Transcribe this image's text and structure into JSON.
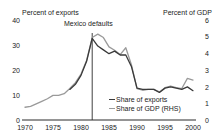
{
  "header": {
    "left_axis_title": "Percent of exports",
    "right_axis_title": "Percent of GDP"
  },
  "annotation": {
    "label": "Mexico defaults",
    "year": 1982
  },
  "legend": {
    "items": [
      {
        "label": "Share of exports",
        "color": "#3a3a3a",
        "axis": "left"
      },
      {
        "label": "Share of GDP (RHS)",
        "color": "#9a9a9a",
        "axis": "right"
      }
    ]
  },
  "axes": {
    "left_ticks": [
      "0",
      "10",
      "20",
      "30",
      "40"
    ],
    "right_ticks": [
      "0",
      "1",
      "2",
      "3",
      "4",
      "5",
      "6"
    ],
    "x_ticks": [
      "1970",
      "1975",
      "1980",
      "1985",
      "1990",
      "1995",
      "2000"
    ]
  },
  "chart_data": {
    "type": "line",
    "title": "",
    "subtitle": "",
    "xlabel": "",
    "ylabel": "Percent of exports",
    "y2label": "Percent of GDP",
    "xlim": [
      1970,
      2000
    ],
    "ylim": [
      0,
      40
    ],
    "y2lim": [
      0,
      6
    ],
    "grid": false,
    "legend_position": "inside-bottom-right",
    "annotations": [
      {
        "text": "Mexico defaults",
        "x": 1982,
        "type": "vline-label"
      }
    ],
    "x": [
      1970,
      1971,
      1972,
      1973,
      1974,
      1975,
      1976,
      1977,
      1978,
      1979,
      1980,
      1981,
      1982,
      1983,
      1984,
      1985,
      1986,
      1987,
      1988,
      1989,
      1990,
      1991,
      1992,
      1993,
      1994,
      1995,
      1996,
      1997,
      1998,
      1999,
      2000
    ],
    "series": [
      {
        "name": "Share of exports",
        "color": "#3a3a3a",
        "axis": "left",
        "units": "percent of exports",
        "values": [
          null,
          null,
          null,
          null,
          null,
          null,
          null,
          null,
          12.0,
          14.0,
          17.5,
          23.0,
          32.0,
          29.0,
          27.5,
          26.0,
          27.0,
          25.5,
          25.5,
          21.0,
          12.5,
          12.0,
          12.0,
          12.0,
          10.8,
          12.5,
          13.0,
          12.5,
          12.0,
          13.0,
          11.5
        ]
      },
      {
        "name": "Share of GDP (RHS)",
        "color": "#9a9a9a",
        "axis": "right",
        "units": "percent of GDP",
        "values": [
          0.75,
          0.8,
          0.95,
          1.1,
          1.25,
          1.45,
          1.45,
          1.55,
          1.85,
          2.2,
          2.7,
          3.5,
          4.85,
          5.05,
          4.85,
          4.3,
          4.1,
          3.85,
          4.25,
          3.25,
          1.85,
          1.75,
          1.8,
          1.8,
          1.65,
          1.9,
          2.0,
          1.9,
          1.85,
          2.45,
          2.35
        ]
      }
    ]
  }
}
